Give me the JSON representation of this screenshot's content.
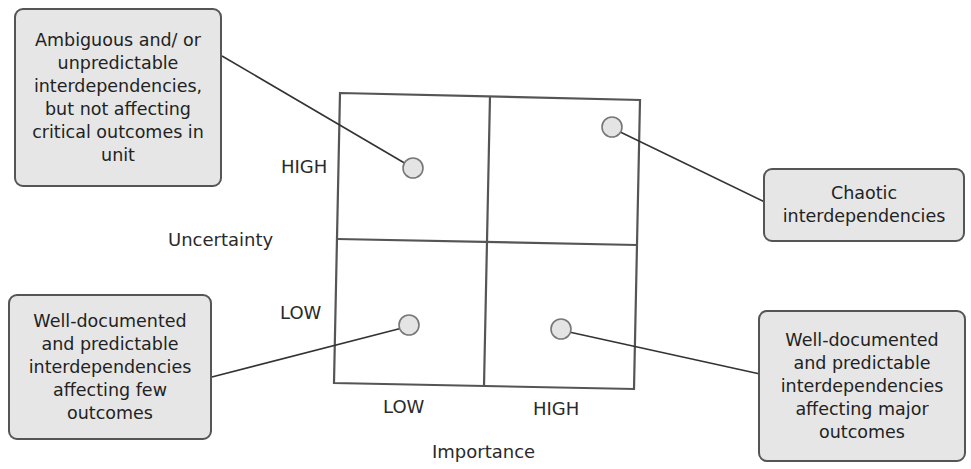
{
  "diagram": {
    "type": "2x2 matrix",
    "x_axis": {
      "title": "Importance",
      "ticks": [
        "LOW",
        "HIGH"
      ]
    },
    "y_axis": {
      "title": "Uncertainty",
      "ticks": [
        "HIGH",
        "LOW"
      ]
    },
    "callouts": [
      {
        "id": "high-uncertainty-low-importance",
        "quadrant": "top-left",
        "text": "Ambiguous and/ or unpredictable interdependencies, but not affecting critical outcomes in unit"
      },
      {
        "id": "high-uncertainty-high-importance",
        "quadrant": "top-right",
        "text": "Chaotic interdependencies"
      },
      {
        "id": "low-uncertainty-low-importance",
        "quadrant": "bottom-left",
        "text": "Well-documented and predictable interdependencies affecting few outcomes"
      },
      {
        "id": "low-uncertainty-high-importance",
        "quadrant": "bottom-right",
        "text": "Well-documented and predictable interdependencies affecting major outcomes"
      }
    ]
  },
  "colors": {
    "box_fill": "#e6e6e6",
    "border": "#555555",
    "line": "#333333",
    "marker_fill": "#e4e4e4"
  }
}
